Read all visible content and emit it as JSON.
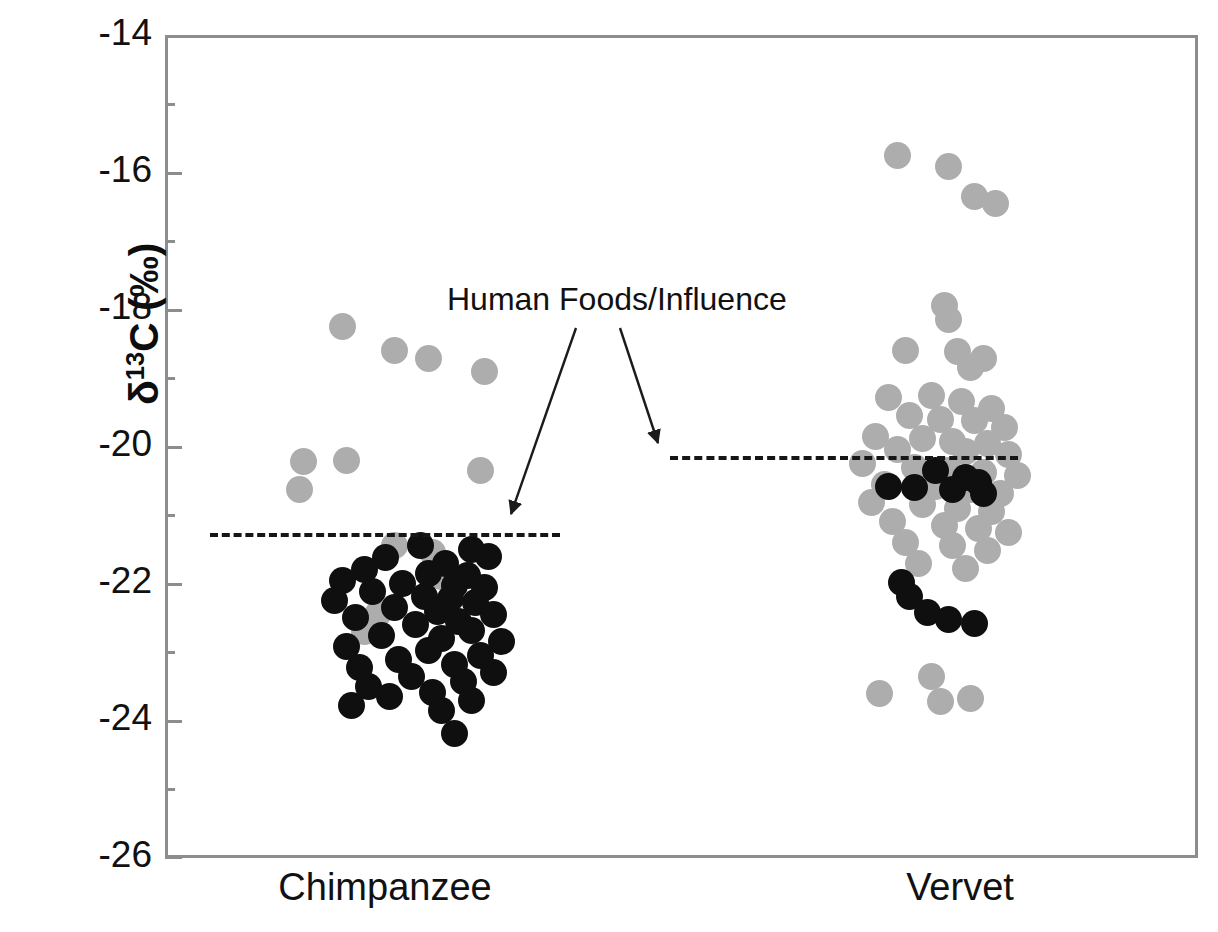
{
  "chart_data": {
    "type": "scatter",
    "title": "",
    "xlabel": "",
    "ylabel": "δ¹13C (‰)",
    "ylabel_parts": {
      "delta": "δ",
      "superscript": "13",
      "element": "C",
      "units": "(‰)"
    },
    "ylim": [
      -26,
      -14
    ],
    "y_major_ticks": [
      -14,
      -16,
      -18,
      -20,
      -22,
      -24,
      -26
    ],
    "y_tick_labels": [
      "-14",
      "-16",
      "-18",
      "-20",
      "-22",
      "-24",
      "-26"
    ],
    "y_minor_ticks": [
      -15,
      -17,
      -19,
      -21,
      -23,
      -25
    ],
    "grid": false,
    "legend": "none",
    "categories": [
      "Chimpanzee",
      "Vervet"
    ],
    "series": [
      {
        "name": "gray-points",
        "color": "#adadad",
        "marker": "circle"
      },
      {
        "name": "black-points",
        "color": "#100f0f",
        "marker": "circle"
      }
    ],
    "annotations": [
      {
        "text": "Human Foods/Influence",
        "arrows": [
          {
            "from_group": "label",
            "to_group": "Chimpanzee",
            "to_value": -21.3
          },
          {
            "from_group": "label",
            "to_group": "Vervet",
            "to_value": -20.1
          }
        ]
      }
    ],
    "reference_lines": [
      {
        "group": "Chimpanzee",
        "value": -21.3,
        "style": "dashed",
        "label": "human-foods-threshold"
      },
      {
        "group": "Vervet",
        "value": -20.1,
        "style": "dashed",
        "label": "human-foods-threshold"
      }
    ],
    "points": {
      "Chimpanzee": {
        "gray": [
          [
            -0.18,
            -18.25
          ],
          [
            -0.06,
            -18.6
          ],
          [
            0.02,
            -18.72
          ],
          [
            0.15,
            -18.9
          ],
          [
            -0.27,
            -20.22
          ],
          [
            -0.17,
            -20.2
          ],
          [
            0.14,
            -20.35
          ],
          [
            -0.28,
            -20.62
          ],
          [
            -0.06,
            -21.45
          ],
          [
            0.03,
            -21.55
          ],
          [
            -0.1,
            -22.45
          ],
          [
            -0.13,
            -22.7
          ],
          [
            0.05,
            -21.9
          ]
        ],
        "black": [
          [
            0.0,
            -21.45
          ],
          [
            0.12,
            -21.5
          ],
          [
            0.16,
            -21.6
          ],
          [
            -0.08,
            -21.62
          ],
          [
            0.06,
            -21.7
          ],
          [
            -0.13,
            -21.8
          ],
          [
            0.02,
            -21.85
          ],
          [
            0.11,
            -21.88
          ],
          [
            -0.18,
            -21.95
          ],
          [
            -0.04,
            -22.0
          ],
          [
            0.08,
            -22.02
          ],
          [
            0.15,
            -22.05
          ],
          [
            -0.11,
            -22.12
          ],
          [
            0.01,
            -22.18
          ],
          [
            0.07,
            -22.22
          ],
          [
            -0.2,
            -22.25
          ],
          [
            0.13,
            -22.28
          ],
          [
            -0.06,
            -22.35
          ],
          [
            0.04,
            -22.4
          ],
          [
            0.17,
            -22.45
          ],
          [
            -0.15,
            -22.5
          ],
          [
            0.09,
            -22.55
          ],
          [
            -0.01,
            -22.6
          ],
          [
            0.12,
            -22.68
          ],
          [
            -0.09,
            -22.75
          ],
          [
            0.05,
            -22.8
          ],
          [
            0.19,
            -22.85
          ],
          [
            -0.17,
            -22.92
          ],
          [
            0.02,
            -22.98
          ],
          [
            0.14,
            -23.05
          ],
          [
            -0.05,
            -23.1
          ],
          [
            0.08,
            -23.18
          ],
          [
            -0.14,
            -23.22
          ],
          [
            0.17,
            -23.3
          ],
          [
            -0.02,
            -23.35
          ],
          [
            0.1,
            -23.42
          ],
          [
            -0.12,
            -23.5
          ],
          [
            0.03,
            -23.58
          ],
          [
            -0.07,
            -23.65
          ],
          [
            0.12,
            -23.7
          ],
          [
            -0.16,
            -23.78
          ],
          [
            0.05,
            -23.85
          ],
          [
            0.08,
            -24.18
          ]
        ]
      },
      "Vervet": {
        "gray": [
          [
            -0.1,
            -15.75
          ],
          [
            0.02,
            -15.92
          ],
          [
            0.08,
            -16.35
          ],
          [
            0.13,
            -16.45
          ],
          [
            0.01,
            -17.95
          ],
          [
            0.02,
            -18.15
          ],
          [
            -0.08,
            -18.6
          ],
          [
            0.04,
            -18.62
          ],
          [
            0.1,
            -18.72
          ],
          [
            0.07,
            -18.85
          ],
          [
            -0.12,
            -19.28
          ],
          [
            -0.02,
            -19.25
          ],
          [
            0.05,
            -19.35
          ],
          [
            0.12,
            -19.45
          ],
          [
            -0.07,
            -19.55
          ],
          [
            0.0,
            -19.6
          ],
          [
            0.08,
            -19.62
          ],
          [
            0.15,
            -19.72
          ],
          [
            -0.15,
            -19.85
          ],
          [
            -0.04,
            -19.88
          ],
          [
            0.03,
            -19.92
          ],
          [
            0.11,
            -19.95
          ],
          [
            -0.1,
            -20.05
          ],
          [
            0.06,
            -20.08
          ],
          [
            0.16,
            -20.12
          ],
          [
            -0.18,
            -20.25
          ],
          [
            -0.06,
            -20.3
          ],
          [
            0.02,
            -20.35
          ],
          [
            0.1,
            -20.38
          ],
          [
            0.18,
            -20.42
          ],
          [
            -0.13,
            -20.55
          ],
          [
            -0.01,
            -20.58
          ],
          [
            0.07,
            -20.62
          ],
          [
            0.14,
            -20.68
          ],
          [
            -0.16,
            -20.82
          ],
          [
            -0.04,
            -20.85
          ],
          [
            0.04,
            -20.9
          ],
          [
            0.12,
            -20.95
          ],
          [
            -0.11,
            -21.1
          ],
          [
            0.01,
            -21.15
          ],
          [
            0.09,
            -21.2
          ],
          [
            0.16,
            -21.25
          ],
          [
            -0.08,
            -21.4
          ],
          [
            0.03,
            -21.45
          ],
          [
            0.11,
            -21.52
          ],
          [
            -0.05,
            -21.7
          ],
          [
            0.06,
            -21.78
          ],
          [
            -0.14,
            -23.6
          ],
          [
            -0.02,
            -23.35
          ],
          [
            0.0,
            -23.72
          ],
          [
            0.07,
            -23.68
          ]
        ],
        "black": [
          [
            -0.01,
            -20.35
          ],
          [
            0.06,
            -20.45
          ],
          [
            0.09,
            -20.52
          ],
          [
            -0.12,
            -20.58
          ],
          [
            -0.06,
            -20.6
          ],
          [
            0.03,
            -20.62
          ],
          [
            0.1,
            -20.68
          ],
          [
            -0.09,
            -21.98
          ],
          [
            -0.07,
            -22.18
          ],
          [
            -0.03,
            -22.42
          ],
          [
            0.02,
            -22.52
          ],
          [
            0.08,
            -22.58
          ]
        ]
      }
    }
  },
  "axis": {
    "x_labels": [
      "Chimpanzee",
      "Vervet"
    ],
    "y_title": "δ"
  },
  "annotation": {
    "label": "Human Foods/Influence"
  }
}
